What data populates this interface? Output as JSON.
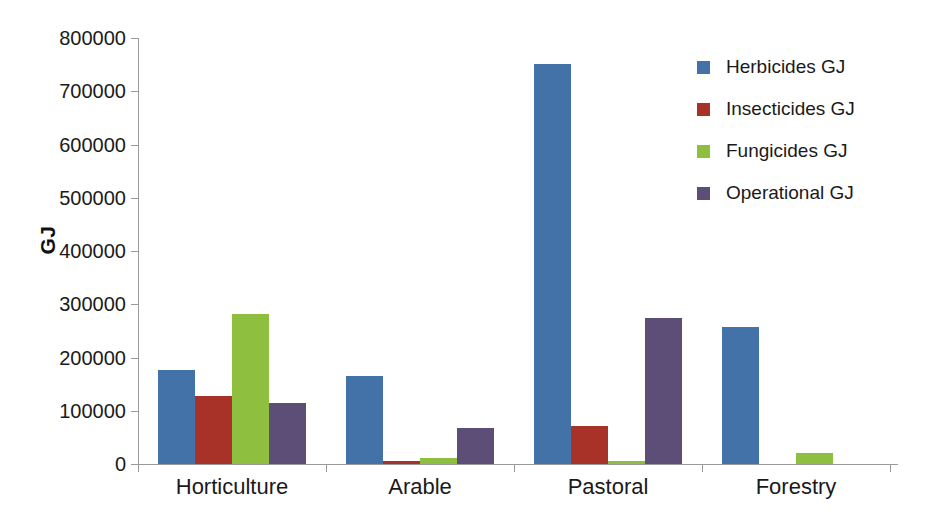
{
  "chart_data": {
    "type": "bar",
    "title": "",
    "subtitle": "",
    "xlabel": "",
    "ylabel": "GJ",
    "ylim": [
      0,
      800000
    ],
    "ytick_step": 100000,
    "yticks": [
      "800000",
      "700000",
      "600000",
      "500000",
      "400000",
      "300000",
      "200000",
      "100000",
      "0"
    ],
    "ytick_values": [
      800000,
      700000,
      600000,
      500000,
      400000,
      300000,
      200000,
      100000,
      0
    ],
    "grid": false,
    "legend_position": "right",
    "categories": [
      "Horticulture",
      "Arable",
      "Pastoral",
      "Forestry"
    ],
    "series": [
      {
        "name": "Herbicides GJ",
        "color": "#4272A8",
        "values": [
          177000,
          166000,
          752000,
          258000
        ]
      },
      {
        "name": "Insecticides GJ",
        "color": "#A83228",
        "values": [
          127000,
          6000,
          71000,
          0
        ]
      },
      {
        "name": "Fungicides GJ",
        "color": "#8FBF3F",
        "values": [
          281000,
          11000,
          5000,
          21000
        ]
      },
      {
        "name": "Operational GJ",
        "color": "#5D4E78",
        "values": [
          114000,
          67000,
          274000,
          0
        ]
      }
    ]
  },
  "axis": {
    "y_title": "GJ"
  },
  "colors": {
    "herbicides": "#4272A8",
    "insecticides": "#A83228",
    "fungicides": "#8FBF3F",
    "operational": "#5D4E78",
    "axis_line": "#9a9a9a",
    "text": "#1a1a1a",
    "background": "#ffffff"
  }
}
